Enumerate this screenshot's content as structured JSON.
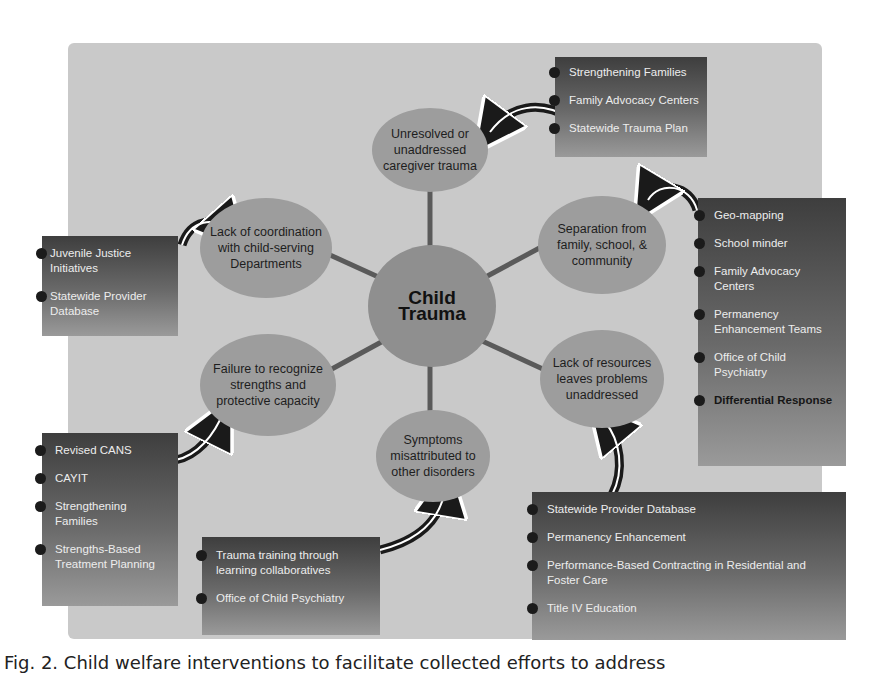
{
  "diagram": {
    "center": "Child Trauma",
    "nodes": [
      {
        "id": "top",
        "label": "Unresolved or unaddressed caregiver trauma"
      },
      {
        "id": "upper-right",
        "label": "Separation from family, school, & community"
      },
      {
        "id": "lower-right",
        "label": "Lack of resources leaves problems unaddressed"
      },
      {
        "id": "bottom",
        "label": "Symptoms misattributed to other disorders"
      },
      {
        "id": "lower-left",
        "label": "Failure to recognize strengths and protective capacity"
      },
      {
        "id": "upper-left",
        "label": "Lack of coordination with child-serving Departments"
      }
    ],
    "boxes": {
      "top": [
        "Strengthening Families",
        "Family Advocacy Centers",
        "Statewide Trauma Plan"
      ],
      "upper_right": [
        "Geo-mapping",
        "School minder",
        "Family Advocacy Centers",
        "Permanency Enhancement Teams",
        "Office of Child Psychiatry",
        "Differential Response"
      ],
      "lower_right": [
        "Statewide Provider Database",
        "Permanency Enhancement",
        "Performance-Based Contracting in Residential and Foster Care",
        "Title IV Education"
      ],
      "bottom": [
        "Trauma training through learning collaboratives",
        "Office of Child Psychiatry"
      ],
      "lower_left": [
        "Revised CANS",
        "CAYIT",
        "Strengthening Families",
        "Strengths-Based Treatment Planning"
      ],
      "upper_left": [
        "Juvenile Justice Initiatives",
        "Statewide Provider Database"
      ]
    }
  },
  "caption": "Fig. 2. Child welfare interventions to facilitate collected efforts to address"
}
